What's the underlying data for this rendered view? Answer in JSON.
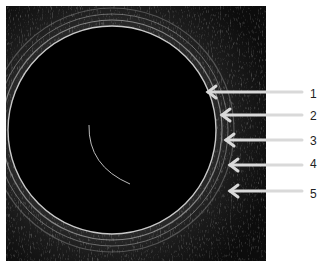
{
  "figure": {
    "arrows": [
      {
        "label": "1",
        "y": 92,
        "tip_x": 208
      },
      {
        "label": "2",
        "y": 115,
        "tip_x": 222
      },
      {
        "label": "3",
        "y": 140,
        "tip_x": 226
      },
      {
        "label": "4",
        "y": 165,
        "tip_x": 230
      },
      {
        "label": "5",
        "y": 191,
        "tip_x": 230
      }
    ],
    "colors": {
      "background": "#000000",
      "arrow": "#d9d9d9",
      "page": "#ffffff"
    }
  }
}
